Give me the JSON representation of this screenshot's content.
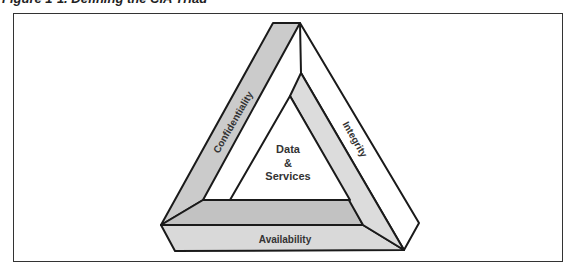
{
  "caption": "Figure 1-1. Defining the CIA Triad",
  "diagram": {
    "title": "CIA Triad",
    "center_label": [
      "Data",
      "&",
      "Services"
    ],
    "sides": {
      "left": "Confidentiality",
      "right": "Integrity",
      "bottom": "Availability"
    },
    "colors": {
      "confidentiality_band": "#cbcbcb",
      "integrity_band": "#dcdcdc",
      "availability_top": "#c2c2c2",
      "availability_front": "#d9d9d9",
      "outline": "#1a1a1a",
      "frame": "#333333"
    }
  }
}
